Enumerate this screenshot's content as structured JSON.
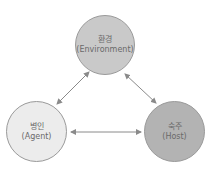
{
  "diagram": {
    "nodes": [
      {
        "id": "environment",
        "label_ko": "환경",
        "label_en": "(Environment)",
        "fill": "#c9c9c9"
      },
      {
        "id": "agent",
        "label_ko": "병인",
        "label_en": "(Agent)",
        "fill": "#ececec"
      },
      {
        "id": "host",
        "label_ko": "숙주",
        "label_en": "(Host)",
        "fill": "#b3b3b3"
      }
    ],
    "edges": [
      {
        "from": "environment",
        "to": "agent",
        "type": "bidirectional"
      },
      {
        "from": "environment",
        "to": "host",
        "type": "bidirectional"
      },
      {
        "from": "agent",
        "to": "host",
        "type": "bidirectional"
      }
    ],
    "arrow_color": "#8a8a8a"
  }
}
